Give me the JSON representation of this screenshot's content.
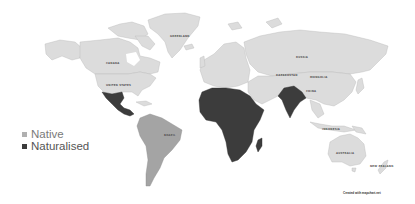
{
  "map": {
    "title": "",
    "legend": [
      {
        "label": "Native",
        "color": "#a8a8a8"
      },
      {
        "label": "Naturalised",
        "color": "#3c3c3c"
      }
    ],
    "labels": {
      "greenland": "GREENLAND",
      "canada": "CANADA",
      "usa": "UNITED STATES",
      "russia": "RUSSIA",
      "china": "CHINA",
      "brazil": "BRAZIL",
      "australia": "AUSTRALIA",
      "indonesia": "INDONESIA",
      "kazakhstan": "KAZAKHSTAN",
      "mongolia": "MONGOLIA",
      "new_zealand": "NEW ZEALAND"
    },
    "credit": "Created with mapchart.net",
    "colors": {
      "native": "#a4a4a4",
      "naturalised": "#3c3c3c",
      "no_data": "#dcdcdc",
      "ocean": "#ffffff"
    }
  }
}
